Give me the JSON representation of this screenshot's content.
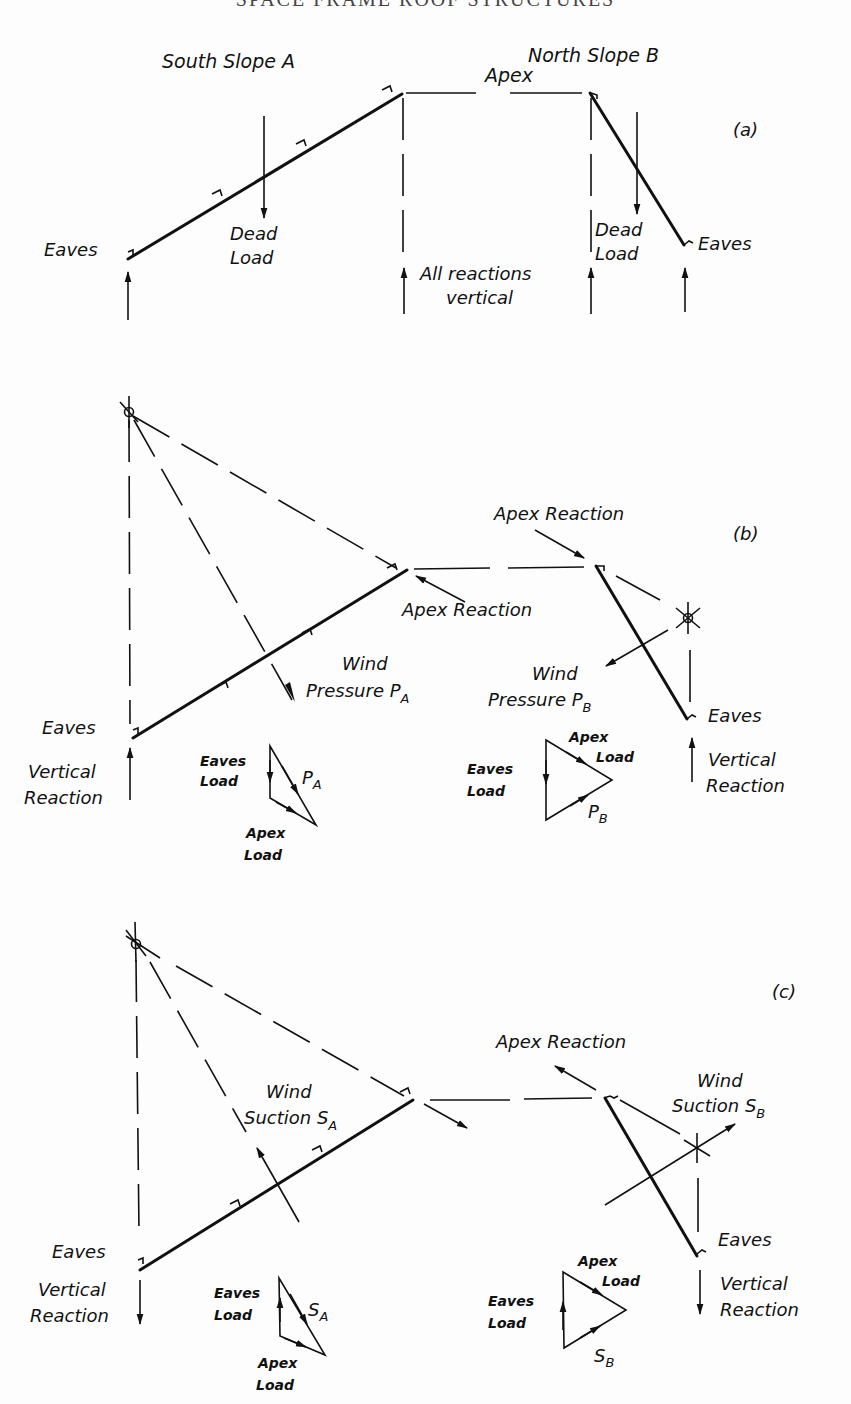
{
  "page": {
    "running_head": "SPACE FRAME ROOF STRUCTURES"
  },
  "figure_a": {
    "tag": "(a)",
    "south_slope": "South Slope A",
    "north_slope": "North Slope B",
    "apex": "Apex",
    "eaves_left": "Eaves",
    "eaves_right": "Eaves",
    "dead_load_left": [
      "Dead",
      "Load"
    ],
    "dead_load_right": [
      "Dead",
      "Load"
    ],
    "reactions_note": [
      "All reactions",
      "vertical"
    ]
  },
  "figure_b": {
    "tag": "(b)",
    "apex_reaction_top": "Apex Reaction",
    "apex_reaction_left": "Apex Reaction",
    "wind_pressure_a": [
      "Wind",
      "Pressure P",
      "A"
    ],
    "wind_pressure_b": [
      "Wind",
      "Pressure P",
      "B"
    ],
    "eaves_left": "Eaves",
    "eaves_right": "Eaves",
    "vertical_reaction_left": [
      "Vertical",
      "Reaction"
    ],
    "vertical_reaction_right": [
      "Vertical",
      "Reaction"
    ],
    "triangle_a": {
      "eaves_load": [
        "Eaves",
        "Load"
      ],
      "apex_load": [
        "Apex",
        "Load"
      ],
      "resultant": [
        "P",
        "A"
      ]
    },
    "triangle_b": {
      "eaves_load": [
        "Eaves",
        "Load"
      ],
      "apex_load": [
        "Apex",
        "Load"
      ],
      "resultant": [
        "P",
        "B"
      ]
    }
  },
  "figure_c": {
    "tag": "(c)",
    "apex_reaction": "Apex Reaction",
    "wind_suction_a": [
      "Wind",
      "Suction S",
      "A"
    ],
    "wind_suction_b": [
      "Wind",
      "Suction S",
      "B"
    ],
    "eaves_left": "Eaves",
    "eaves_right": "Eaves",
    "vertical_reaction_left": [
      "Vertical",
      "Reaction"
    ],
    "vertical_reaction_right": [
      "Vertical",
      "Reaction"
    ],
    "triangle_a": {
      "eaves_load": [
        "Eaves",
        "Load"
      ],
      "apex_load": [
        "Apex",
        "Load"
      ],
      "resultant": [
        "S",
        "A"
      ]
    },
    "triangle_b": {
      "eaves_load": [
        "Eaves",
        "Load"
      ],
      "apex_load": [
        "Apex",
        "Load"
      ],
      "resultant": [
        "S",
        "B"
      ]
    }
  },
  "colors": {
    "ink": "#111111",
    "paper": "#fdfdfd"
  }
}
